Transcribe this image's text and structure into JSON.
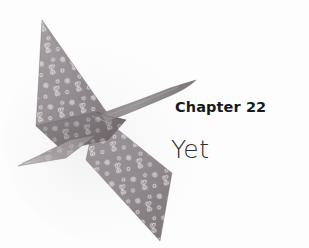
{
  "page": {
    "background_color": "#fdfdfd",
    "width": 309,
    "height": 248
  },
  "chapter": {
    "heading": "Chapter 22",
    "title": "Yet"
  },
  "illustration": {
    "name": "origami-paper-crane",
    "description": "Folded origami crane in flight, wings spread, made of gray-mauve paper with a small white floral and butterfly print",
    "paper_color": "#9a9398",
    "paper_shadow_color": "#6f696d",
    "paper_highlight_color": "#b7b1b5",
    "pattern_color": "#e8e4e6"
  }
}
